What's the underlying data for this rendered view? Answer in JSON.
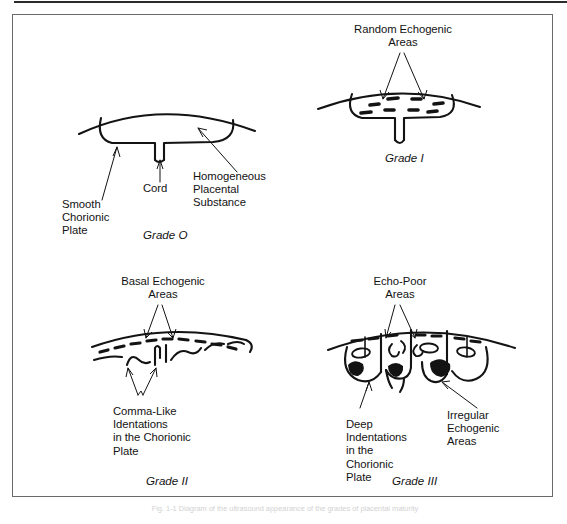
{
  "figure": {
    "caption": "Fig. 1-1 Diagram of the ultrasound appearance of the grades of placental maturity"
  },
  "panels": [
    {
      "id": "grade-0",
      "grade_label": "Grade O",
      "annotations": [
        {
          "id": "smooth-chorionic-plate",
          "text": "Smooth\nChorionic\nPlate"
        },
        {
          "id": "cord",
          "text": "Cord"
        },
        {
          "id": "homogeneous-placental-substance",
          "text": "Homogeneous\nPlacental\nSubstance"
        }
      ]
    },
    {
      "id": "grade-1",
      "grade_label": "Grade I",
      "annotations": [
        {
          "id": "random-echogenic-areas",
          "text": "Random Echogenic\nAreas"
        }
      ]
    },
    {
      "id": "grade-2",
      "grade_label": "Grade II",
      "annotations": [
        {
          "id": "basal-echogenic-areas",
          "text": "Basal Echogenic\nAreas"
        },
        {
          "id": "comma-like-identations",
          "text": "Comma-Like\nIdentations\nin the Chorionic\nPlate"
        }
      ]
    },
    {
      "id": "grade-3",
      "grade_label": "Grade III",
      "annotations": [
        {
          "id": "echo-poor-areas",
          "text": "Echo-Poor\nAreas"
        },
        {
          "id": "deep-indentations",
          "text": "Deep\nIndentations\nin the\nChorionic\nPlate"
        },
        {
          "id": "irregular-echogenic-areas",
          "text": "Irregular\nEchogenic\nAreas"
        }
      ]
    }
  ],
  "colors": {
    "ink": "#131313",
    "frame": "#6a6a6a",
    "paper": "#ffffff"
  }
}
